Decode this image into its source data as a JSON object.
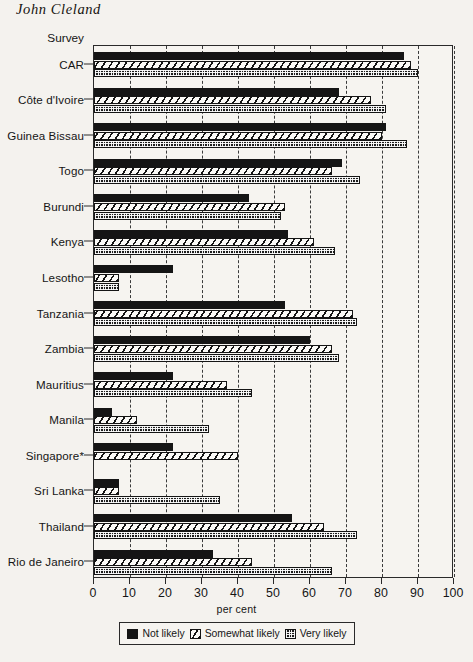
{
  "running_head": "John Cleland",
  "chart_data": {
    "type": "bar",
    "orientation": "horizontal",
    "title": "",
    "category_axis_title": "Survey",
    "xlabel": "per cent",
    "ylabel": "",
    "xlim": [
      0,
      100
    ],
    "xticks": [
      0,
      10,
      20,
      30,
      40,
      50,
      60,
      70,
      80,
      90,
      100
    ],
    "xticklabels": [
      "0",
      "10",
      "20",
      "30",
      "40",
      "50",
      "60",
      "70",
      "80",
      "90",
      "100"
    ],
    "grid": "vertical-dashed",
    "legend_position": "bottom",
    "categories": [
      "CAR",
      "Côte d'Ivoire",
      "Guinea Bissau",
      "Togo",
      "Burundi",
      "Kenya",
      "Lesotho",
      "Tanzania",
      "Zambia",
      "Mauritius",
      "Manila",
      "Singapore*",
      "Sri Lanka",
      "Thailand",
      "Rio de Janeiro"
    ],
    "series": [
      {
        "name": "Not likely",
        "pattern": "solid-black",
        "values": [
          86,
          68,
          81,
          69,
          43,
          54,
          22,
          53,
          60,
          22,
          5,
          22,
          7,
          55,
          33
        ]
      },
      {
        "name": "Somewhat likely",
        "pattern": "diagonal-hatch",
        "values": [
          88,
          77,
          80,
          66,
          53,
          61,
          7,
          72,
          66,
          37,
          12,
          40,
          7,
          64,
          44
        ]
      },
      {
        "name": "Very likely",
        "pattern": "dotted-stipple",
        "values": [
          90,
          81,
          87,
          74,
          52,
          67,
          7,
          73,
          68,
          44,
          32,
          0,
          35,
          73,
          66
        ]
      }
    ]
  },
  "legend": {
    "items": [
      {
        "label": "Not likely",
        "swatch": "solid-black-swatch"
      },
      {
        "label": "Somewhat likely",
        "swatch": "diagonal-hatch-swatch"
      },
      {
        "label": "Very likely",
        "swatch": "dotted-stipple-swatch"
      }
    ]
  }
}
